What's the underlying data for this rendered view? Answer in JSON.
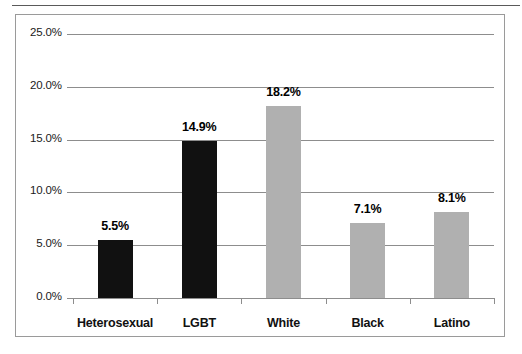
{
  "chart_data": {
    "type": "bar",
    "title": "",
    "subtitle": "",
    "xlabel": "",
    "ylabel": "",
    "categories": [
      "Heterosexual",
      "LGBT",
      "White",
      "Black",
      "Latino"
    ],
    "values": [
      5.5,
      14.9,
      18.2,
      7.1,
      8.1
    ],
    "value_labels": [
      "5.5%",
      "14.9%",
      "18.2%",
      "7.1%",
      "8.1%"
    ],
    "bar_colors": [
      "#111111",
      "#111111",
      "#b0b0b0",
      "#b0b0b0",
      "#b0b0b0"
    ],
    "ylim": [
      0,
      25
    ],
    "ytick_values": [
      0,
      5,
      10,
      15,
      20,
      25
    ],
    "ytick_labels": [
      "0.0%",
      "5.0%",
      "10.0%",
      "15.0%",
      "20.0%",
      "25.0%"
    ],
    "grid": true,
    "grid_axis": "y",
    "legend": false,
    "legend_position": "none",
    "axis_color": "#8d8d8d",
    "plot_background": "#ffffff",
    "frame_border_color": "#9a9a9a"
  }
}
